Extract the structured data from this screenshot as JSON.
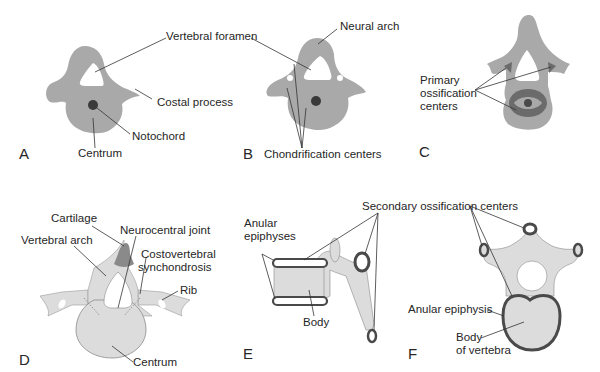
{
  "figure": {
    "colors": {
      "background": "#ffffff",
      "mesenchyme_gray": "#a9a9a9",
      "ossification_dark": "#6b6b6b",
      "notochord": "#3a3a3a",
      "bone_light": "#dcdcdc",
      "cartilage": "#8a8a8a",
      "epiphysis_ring": "#4a4a4a",
      "leader_line": "#333333"
    },
    "panels": [
      {
        "id": "A",
        "letter": "A",
        "labels": {
          "vertebral_foramen": "Vertebral foramen",
          "costal_process": "Costal process",
          "notochord": "Notochord",
          "centrum": "Centrum"
        }
      },
      {
        "id": "B",
        "letter": "B",
        "labels": {
          "neural_arch": "Neural arch",
          "chondrification_centers": "Chondrification centers"
        }
      },
      {
        "id": "C",
        "letter": "C",
        "labels": {
          "primary_ossification_centers": "Primary\nossification\ncenters",
          "primary_line1": "Primary",
          "primary_line2": "ossification",
          "primary_line3": "centers"
        }
      },
      {
        "id": "D",
        "letter": "D",
        "labels": {
          "cartilage": "Cartilage",
          "vertebral_arch": "Vertebral arch",
          "neurocentral_joint": "Neurocentral joint",
          "costovertebral_line1": "Costovertebral",
          "costovertebral_line2": "synchondrosis",
          "rib": "Rib",
          "centrum": "Centrum"
        }
      },
      {
        "id": "E",
        "letter": "E",
        "labels": {
          "anular_line1": "Anular",
          "anular_line2": "epiphyses",
          "body": "Body",
          "secondary_ossification_centers": "Secondary ossification centers"
        }
      },
      {
        "id": "F",
        "letter": "F",
        "labels": {
          "anular_epiphysis": "Anular epiphysis",
          "body_line1": "Body",
          "body_line2": "of vertebra"
        }
      }
    ]
  }
}
